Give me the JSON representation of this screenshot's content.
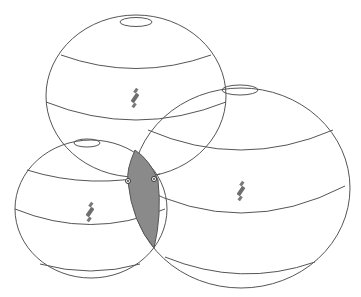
{
  "diagram": {
    "title": "",
    "colors": {
      "stroke": "#555555",
      "shade": "#8a8a8a",
      "satellite": "#6e6e6e",
      "background": "#ffffff"
    },
    "spheres": [
      {
        "id": "top",
        "cx": 136,
        "cy": 96,
        "rx": 90,
        "ry": 81,
        "satellite_icon": "satellite-icon"
      },
      {
        "id": "right",
        "cx": 241,
        "cy": 188,
        "rx": 109,
        "ry": 100,
        "satellite_icon": "satellite-icon"
      },
      {
        "id": "left",
        "cx": 91,
        "cy": 209,
        "rx": 76,
        "ry": 69,
        "satellite_icon": "satellite-icon"
      }
    ],
    "intersection_points": [
      {
        "x": 128,
        "y": 181
      },
      {
        "x": 154,
        "y": 179
      }
    ]
  }
}
